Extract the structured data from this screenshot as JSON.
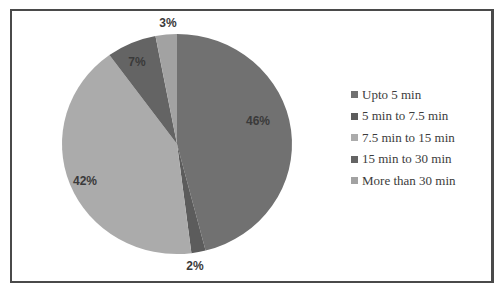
{
  "chart_data": {
    "type": "pie",
    "title": "",
    "categories": [
      "Upto 5 min",
      "5 min to 7.5 min",
      "7.5 min  to 15 min",
      "15 min to 30 min",
      "More than 30 min"
    ],
    "values": [
      46,
      2,
      42,
      7,
      3
    ],
    "labels": [
      "46%",
      "2%",
      "42%",
      "7%",
      "3%"
    ],
    "colors": [
      "#717171",
      "#5c5c5c",
      "#ababab",
      "#646464",
      "#a2a2a2"
    ],
    "legend_position": "right",
    "start_angle": "12 o'clock, clockwise"
  },
  "legend": {
    "items": [
      {
        "label": "Upto 5 min",
        "color": "#717171"
      },
      {
        "label": "5 min to 7.5 min",
        "color": "#5c5c5c"
      },
      {
        "label": "7.5 min  to 15 min",
        "color": "#ababab"
      },
      {
        "label": "15 min to 30 min",
        "color": "#646464"
      },
      {
        "label": "More than 30 min",
        "color": "#a2a2a2"
      }
    ]
  }
}
